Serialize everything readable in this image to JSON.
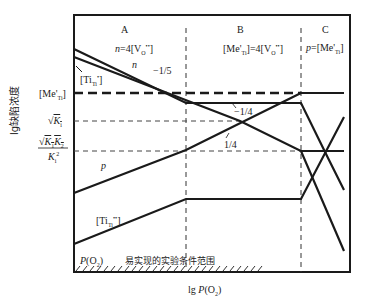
{
  "diagram": {
    "type": "Brouwer defect diagram",
    "regions": [
      {
        "id": "A",
        "condition": "n=4[V_O^••]"
      },
      {
        "id": "B",
        "condition": "[Me'_Ti]=4[V_O^••]"
      },
      {
        "id": "C",
        "condition": "p=[Me'_Ti]"
      }
    ],
    "region_labels": {
      "A": "A",
      "B": "B",
      "C": "C"
    },
    "region_conditions": {
      "A": "n=4[V",
      "B": "[Me'",
      "C": "p=[Me'"
    },
    "curve_labels": {
      "n": "n",
      "p": "p",
      "ti_upper": "[Ti",
      "ti_lower": "[Ti"
    },
    "slopes": {
      "n_A": "−1/5",
      "n_B": "−1/4",
      "p_B": "1/4"
    },
    "y_ticks": {
      "me": "[Me'",
      "sqrtKi": "√K",
      "ratio_num": "√K",
      "ratio_den": "K"
    },
    "x_axis_label": "lg P(O",
    "y_axis_label": "lg缺陷浓度",
    "bottom_note_po2": "P(O",
    "bottom_note": "易实现的实验条件范围",
    "colors": {
      "line": "#1a1a1a",
      "background": "#ffffff"
    }
  }
}
